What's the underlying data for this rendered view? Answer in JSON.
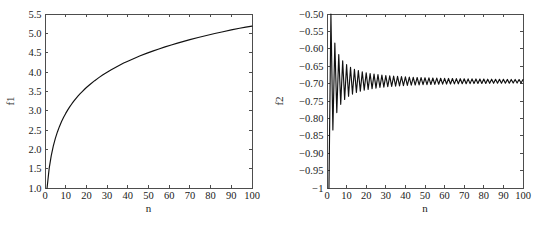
{
  "figure": {
    "background": "#ffffff",
    "axis_color": "#4d4d4d",
    "curve_color": "#111111",
    "panel_count": 2
  },
  "chart_data": [
    {
      "id": "panel-left",
      "type": "line",
      "title": "",
      "xlabel": "n",
      "ylabel": "f1",
      "xlim": [
        0,
        100
      ],
      "ylim": [
        1.0,
        5.5
      ],
      "grid": false,
      "legend": null,
      "xticks": [
        0,
        10,
        20,
        30,
        40,
        50,
        60,
        70,
        80,
        90,
        100
      ],
      "xticklabels": [
        "0",
        "10",
        "20",
        "30",
        "40",
        "50",
        "60",
        "70",
        "80",
        "90",
        "100"
      ],
      "yticks": [
        1.0,
        1.5,
        2.0,
        2.5,
        3.0,
        3.5,
        4.0,
        4.5,
        5.0,
        5.5
      ],
      "yticklabels": [
        "1.0",
        "1.5",
        "2.0",
        "2.5",
        "3.0",
        "3.5",
        "4.0",
        "4.5",
        "5.0",
        "5.5"
      ],
      "series": [
        {
          "name": "f1",
          "x": [
            1,
            2,
            3,
            4,
            5,
            6,
            7,
            8,
            9,
            10,
            11,
            12,
            13,
            14,
            15,
            16,
            17,
            18,
            19,
            20,
            22,
            24,
            26,
            28,
            30,
            32,
            34,
            36,
            38,
            40,
            43,
            46,
            49,
            52,
            55,
            58,
            61,
            64,
            67,
            70,
            74,
            78,
            82,
            86,
            90,
            94,
            97,
            100
          ],
          "values": [
            1.0,
            1.5,
            1.833,
            2.083,
            2.283,
            2.45,
            2.593,
            2.718,
            2.829,
            2.929,
            3.02,
            3.103,
            3.18,
            3.252,
            3.318,
            3.381,
            3.44,
            3.495,
            3.548,
            3.598,
            3.69,
            3.776,
            3.854,
            3.927,
            3.995,
            4.059,
            4.119,
            4.176,
            4.231,
            4.278,
            4.351,
            4.418,
            4.481,
            4.54,
            4.596,
            4.649,
            4.7,
            4.748,
            4.793,
            4.837,
            4.893,
            4.945,
            4.995,
            5.042,
            5.088,
            5.131,
            5.162,
            5.187
          ]
        }
      ]
    },
    {
      "id": "panel-right",
      "type": "line",
      "title": "",
      "xlabel": "n",
      "ylabel": "f2",
      "xlim": [
        0,
        100
      ],
      "ylim": [
        -1.0,
        -0.5
      ],
      "grid": false,
      "legend": null,
      "xticks": [
        0,
        10,
        20,
        30,
        40,
        50,
        60,
        70,
        80,
        90,
        100
      ],
      "xticklabels": [
        "0",
        "10",
        "20",
        "30",
        "40",
        "50",
        "60",
        "70",
        "80",
        "90",
        "100"
      ],
      "yticks": [
        -1.0,
        -0.95,
        -0.9,
        -0.85,
        -0.8,
        -0.75,
        -0.7,
        -0.65,
        -0.6,
        -0.55,
        -0.5
      ],
      "yticklabels": [
        "−1",
        "−0.95",
        "−0.90",
        "−0.85",
        "−0.80",
        "−0.75",
        "−0.70",
        "−0.65",
        "−0.60",
        "−0.55",
        "−0.50"
      ],
      "converges_to": -0.693,
      "series": [
        {
          "name": "f2",
          "x": [
            1,
            2,
            3,
            4,
            5,
            6,
            7,
            8,
            9,
            10,
            11,
            12,
            13,
            14,
            15,
            16,
            17,
            18,
            19,
            20,
            21,
            22,
            23,
            24,
            25,
            26,
            27,
            28,
            29,
            30,
            31,
            32,
            33,
            34,
            35,
            36,
            37,
            38,
            39,
            40,
            41,
            42,
            43,
            44,
            45,
            46,
            47,
            48,
            49,
            50,
            51,
            52,
            53,
            54,
            55,
            56,
            57,
            58,
            59,
            60,
            61,
            62,
            63,
            64,
            65,
            66,
            67,
            68,
            69,
            70,
            71,
            72,
            73,
            74,
            75,
            76,
            77,
            78,
            79,
            80,
            81,
            82,
            83,
            84,
            85,
            86,
            87,
            88,
            89,
            90,
            91,
            92,
            93,
            94,
            95,
            96,
            97,
            98,
            99,
            100
          ],
          "values": [
            -1.0,
            -0.5,
            -0.8333,
            -0.5833,
            -0.7833,
            -0.6167,
            -0.7595,
            -0.6345,
            -0.7456,
            -0.6456,
            -0.7365,
            -0.6532,
            -0.7301,
            -0.6587,
            -0.7253,
            -0.6628,
            -0.7217,
            -0.6662,
            -0.7188,
            -0.6688,
            -0.7164,
            -0.671,
            -0.7145,
            -0.6728,
            -0.7128,
            -0.6743,
            -0.7113,
            -0.6756,
            -0.7101,
            -0.6768,
            -0.709,
            -0.6777,
            -0.708,
            -0.6786,
            -0.7072,
            -0.6794,
            -0.7064,
            -0.6801,
            -0.7058,
            -0.6808,
            -0.7052,
            -0.6814,
            -0.7046,
            -0.6819,
            -0.7041,
            -0.6824,
            -0.7037,
            -0.6828,
            -0.7032,
            -0.6832,
            -0.7029,
            -0.6836,
            -0.7025,
            -0.684,
            -0.7022,
            -0.6844,
            -0.7019,
            -0.6847,
            -0.7016,
            -0.685,
            -0.7013,
            -0.6852,
            -0.7011,
            -0.6855,
            -0.7009,
            -0.6857,
            -0.7006,
            -0.6859,
            -0.7004,
            -0.6862,
            -0.7003,
            -0.6864,
            -0.7,
            -0.6865,
            -0.6999,
            -0.6867,
            -0.6997,
            -0.6869,
            -0.6996,
            -0.6871,
            -0.6994,
            -0.6872,
            -0.6993,
            -0.6874,
            -0.6992,
            -0.6875,
            -0.699,
            -0.6876,
            -0.6989,
            -0.6878,
            -0.6988,
            -0.6879,
            -0.6987,
            -0.688,
            -0.6985,
            -0.6881,
            -0.6985,
            -0.6883,
            -0.6984,
            -0.6884
          ]
        }
      ]
    }
  ]
}
